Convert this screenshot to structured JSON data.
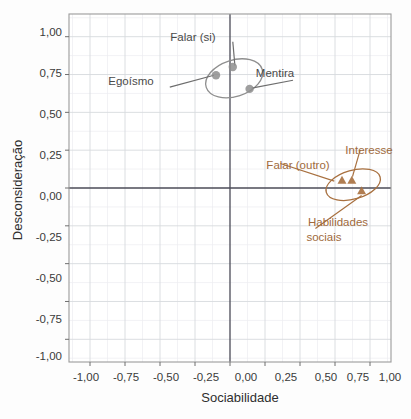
{
  "chart_data": {
    "type": "scatter",
    "title": "",
    "subtitle": "",
    "xlabel": "Sociabilidade",
    "ylabel": "Desconsideração",
    "xlim": [
      -1.15,
      1.15
    ],
    "ylim": [
      -1.15,
      1.15
    ],
    "xticks": [
      "-1,00",
      "-0,75",
      "-0,50",
      "-0,25",
      "0,00",
      "0,25",
      "0,50",
      "0,75",
      "1,00"
    ],
    "xtick_values": [
      -1.0,
      -0.75,
      -0.5,
      -0.25,
      0.0,
      0.25,
      0.5,
      0.75,
      1.0
    ],
    "yticks": [
      "1,00",
      "0,75",
      "0,50",
      "0,25",
      "0,00",
      "-0,25",
      "-0,50",
      "-0,75",
      "-1,00"
    ],
    "ytick_values": [
      1.0,
      0.75,
      0.5,
      0.25,
      0.0,
      -0.25,
      -0.5,
      -0.75,
      -1.0
    ],
    "grid": true,
    "minor_grid": true,
    "legend": "none",
    "zero_axes": true,
    "colors": {
      "group_gray": "#8e8e8e",
      "group_brown": "#a8703f",
      "axis": "#4b4b57",
      "grid_major": "#d5d8df",
      "grid_minor": "#e9ebef",
      "frame": "#9a9a9a",
      "text": "#3a3a3a"
    },
    "series": [
      {
        "name": "Grupo cinza",
        "marker": "circle",
        "color": "#8e8e8e",
        "points": [
          {
            "label": "Falar (si)",
            "x": 0.02,
            "y": 0.8
          },
          {
            "label": "Egoísmo",
            "x": -0.1,
            "y": 0.745
          },
          {
            "label": "Mentira",
            "x": 0.14,
            "y": 0.655
          }
        ],
        "ellipse": {
          "cx": 0.03,
          "cy": 0.725,
          "rx": 0.21,
          "ry": 0.12,
          "angle": -18
        }
      },
      {
        "name": "Grupo marrom",
        "marker": "triangle",
        "color": "#a8703f",
        "points": [
          {
            "label": "Falar (outro)",
            "x": 0.8,
            "y": 0.055
          },
          {
            "label": "Interesse",
            "x": 0.87,
            "y": 0.055
          },
          {
            "label": "Habilidades sociais",
            "x": 0.94,
            "y": -0.015
          }
        ],
        "ellipse": {
          "cx": 0.88,
          "cy": 0.022,
          "rx": 0.2,
          "ry": 0.095,
          "angle": -16
        }
      }
    ],
    "annotations": [
      {
        "text": "Falar (si)",
        "color": "gray",
        "lx": 0.02,
        "ly": 1.0,
        "tx": 0.035,
        "ty": 0.81,
        "anchor": "middle"
      },
      {
        "text": "Egoísmo",
        "color": "gray",
        "lx": -0.43,
        "ly": 0.7,
        "tx": -0.115,
        "ty": 0.745,
        "anchor": "middle"
      },
      {
        "text": "Mentira",
        "color": "gray",
        "lx": 0.45,
        "ly": 0.745,
        "tx": 0.155,
        "ty": 0.66,
        "anchor": "middle"
      },
      {
        "text": "Falar (outro)",
        "color": "brown",
        "lx": 0.36,
        "ly": 0.195,
        "tx": 0.745,
        "ty": 0.045,
        "anchor": "middle"
      },
      {
        "text": "Interesse",
        "color": "brown",
        "lx": 0.93,
        "ly": 0.285,
        "tx": 0.875,
        "ty": 0.075,
        "anchor": "middle"
      },
      {
        "text": "Habilidades",
        "color": "brown",
        "lx": 0.61,
        "ly": -0.235,
        "tx": 0.94,
        "ty": -0.05,
        "anchor": "middle"
      },
      {
        "text": "sociais",
        "color": "brown",
        "lx": 0.525,
        "ly": -0.345,
        "tx": null,
        "ty": null,
        "anchor": "middle"
      }
    ]
  },
  "labels": {
    "x_axis_title": "Sociabilidade",
    "y_axis_title": "Desconsideração",
    "falar_si": "Falar (si)",
    "egoismo": "Egoísmo",
    "mentira": "Mentira",
    "falar_outro": "Falar (outro)",
    "interesse": "Interesse",
    "habilidades_line1": "Habilidades",
    "habilidades_line2": "sociais",
    "x_t0": "-1,00",
    "x_t1": "-0,75",
    "x_t2": "-0,50",
    "x_t3": "-0,25",
    "x_t4": "0,00",
    "x_t5": "0,25",
    "x_t6": "0,50",
    "x_t7": "0,75",
    "x_t8": "1,00",
    "y_t0": "1,00",
    "y_t1": "0,75",
    "y_t2": "0,50",
    "y_t3": "0,25",
    "y_t4": "0,00",
    "y_t5": "-0,25",
    "y_t6": "-0,50",
    "y_t7": "-0,75",
    "y_t8": "-1,00"
  }
}
